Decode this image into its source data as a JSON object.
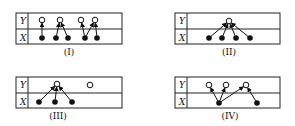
{
  "figure": {
    "row_labels": {
      "top": "Y",
      "bottom": "X"
    },
    "panels": [
      {
        "id": "I",
        "caption": "(I)",
        "box": {
          "x": 16,
          "y": 13,
          "w": 106,
          "h": 31,
          "mid": 29,
          "sep": 28
        },
        "y_nodes": [
          {
            "x": 42,
            "y": 20
          },
          {
            "x": 60,
            "y": 20
          },
          {
            "x": 81,
            "y": 20
          },
          {
            "x": 95,
            "y": 20
          }
        ],
        "x_nodes": [
          {
            "x": 42,
            "y": 38
          },
          {
            "x": 56,
            "y": 38
          },
          {
            "x": 68,
            "y": 38
          },
          {
            "x": 85,
            "y": 38
          },
          {
            "x": 97,
            "y": 38
          }
        ],
        "edges": [
          [
            0,
            0
          ],
          [
            1,
            1
          ],
          [
            2,
            1
          ],
          [
            3,
            2
          ],
          [
            3,
            3
          ],
          [
            4,
            3
          ]
        ],
        "caption_pos": {
          "x": 69,
          "y": 55
        }
      },
      {
        "id": "II",
        "caption": "(II)",
        "box": {
          "x": 175,
          "y": 13,
          "w": 105,
          "h": 31,
          "mid": 29,
          "sep": 187
        },
        "y_nodes": [
          {
            "x": 229,
            "y": 21
          }
        ],
        "x_nodes": [
          {
            "x": 209,
            "y": 38
          },
          {
            "x": 222,
            "y": 38
          },
          {
            "x": 236,
            "y": 38
          },
          {
            "x": 250,
            "y": 38
          }
        ],
        "edges": [
          [
            0,
            0
          ],
          [
            1,
            0
          ],
          [
            2,
            0
          ],
          [
            3,
            0
          ]
        ],
        "caption_pos": {
          "x": 229,
          "y": 55
        }
      },
      {
        "id": "III",
        "caption": "(III)",
        "box": {
          "x": 16,
          "y": 77,
          "w": 106,
          "h": 31,
          "mid": 93,
          "sep": 28
        },
        "y_nodes": [
          {
            "x": 57,
            "y": 84
          },
          {
            "x": 90,
            "y": 85
          }
        ],
        "x_nodes": [
          {
            "x": 39,
            "y": 102
          },
          {
            "x": 55,
            "y": 102
          },
          {
            "x": 72,
            "y": 102
          }
        ],
        "edges": [
          [
            0,
            0
          ],
          [
            1,
            0
          ],
          [
            2,
            0
          ]
        ],
        "caption_pos": {
          "x": 58,
          "y": 119
        }
      },
      {
        "id": "IV",
        "caption": "(IV)",
        "box": {
          "x": 175,
          "y": 77,
          "w": 105,
          "h": 31,
          "mid": 93,
          "sep": 187
        },
        "y_nodes": [
          {
            "x": 209,
            "y": 85
          },
          {
            "x": 226,
            "y": 85
          },
          {
            "x": 246,
            "y": 85
          }
        ],
        "x_nodes": [
          {
            "x": 219,
            "y": 103
          },
          {
            "x": 257,
            "y": 103
          }
        ],
        "edges": [
          [
            0,
            0
          ],
          [
            0,
            1
          ],
          [
            0,
            2
          ],
          [
            1,
            2
          ]
        ],
        "caption_pos": {
          "x": 230,
          "y": 119
        }
      }
    ]
  }
}
